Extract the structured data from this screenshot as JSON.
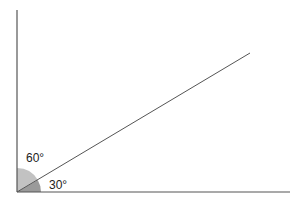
{
  "diagram": {
    "type": "angle-diagram",
    "labels": {
      "angle_upper": "60°",
      "angle_lower": "30°"
    },
    "angles": {
      "upper_degrees": 60,
      "lower_degrees": 30
    },
    "colors": {
      "line": "#555555",
      "sector_upper": "#c2c2c2",
      "sector_lower": "#9a9a9a",
      "text": "#222222"
    }
  }
}
